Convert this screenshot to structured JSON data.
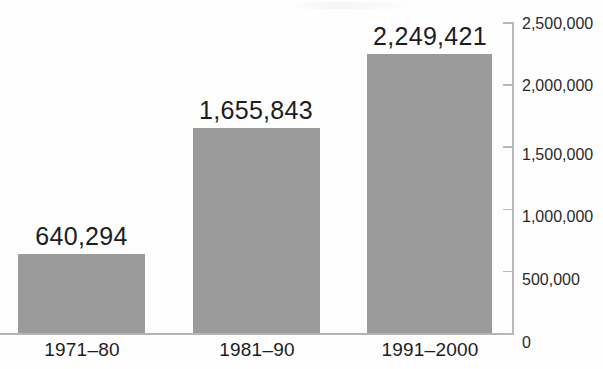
{
  "chart_data": {
    "type": "bar",
    "title": "",
    "subtitle": "",
    "xlabel": "",
    "ylabel": "",
    "categories": [
      "1971–80",
      "1981–90",
      "1991–2000"
    ],
    "values": [
      640294,
      1655843,
      2249421
    ],
    "value_labels": [
      "640,294",
      "1,655,843",
      "2,249,421"
    ],
    "ylim": [
      0,
      2500000
    ],
    "ytick_values": [
      0,
      500000,
      1000000,
      1500000,
      2000000,
      2500000
    ],
    "ytick_labels": [
      "0",
      "500,000",
      "1,000,000",
      "1,500,000",
      "2,000,000",
      "2,500,000"
    ],
    "y_axis_position": "right",
    "grid": false,
    "legend": false,
    "bar_color": "#9b9b9b",
    "axis_color": "#b9b9b9",
    "text_color": "#1d1d1d",
    "background_color": "#ffffff"
  },
  "bars": [
    {
      "category": "1971–80",
      "value_label": "640,294"
    },
    {
      "category": "1981–90",
      "value_label": "1,655,843"
    },
    {
      "category": "1991–2000",
      "value_label": "2,249,421"
    }
  ],
  "y_axis": {
    "ticks": [
      {
        "label": "2,500,000"
      },
      {
        "label": "2,000,000"
      },
      {
        "label": "1,500,000"
      },
      {
        "label": "1,000,000"
      },
      {
        "label": "500,000"
      },
      {
        "label": "0"
      }
    ]
  }
}
